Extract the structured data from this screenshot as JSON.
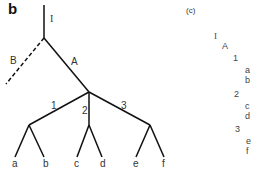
{
  "panel_b": {
    "label": "b",
    "edges": {
      "I": "I",
      "A": "A",
      "B": "B",
      "one": "1",
      "two": "2",
      "three": "3"
    },
    "leaves": [
      "a",
      "b",
      "c",
      "d",
      "e",
      "f"
    ]
  },
  "panel_c": {
    "label": "(c)",
    "outline": [
      "I",
      "A",
      "1",
      "a",
      "b",
      "2",
      "c",
      "d",
      "3",
      "e",
      "f"
    ]
  },
  "colors": {
    "line": "#111111",
    "text": "#333333"
  }
}
